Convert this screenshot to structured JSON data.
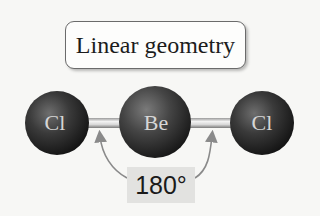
{
  "title": "Linear geometry",
  "molecule": {
    "atoms": [
      {
        "symbol": "Cl",
        "position": "left"
      },
      {
        "symbol": "Be",
        "position": "center"
      },
      {
        "symbol": "Cl",
        "position": "right"
      }
    ],
    "bond_angle_label": "180°"
  },
  "colors": {
    "background": "#f7f7f5",
    "atom_dark": "#1a1a1a",
    "atom_highlight": "#6a6a6a",
    "atom_label": "#d6d6d6",
    "angle_box": "#e2e2e0",
    "arc": "#8a8a8a"
  }
}
